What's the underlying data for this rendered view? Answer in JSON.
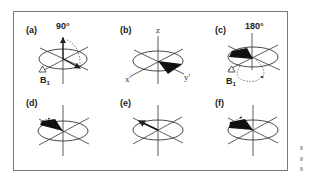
{
  "figure": {
    "panels": [
      {
        "id": "a",
        "label": "(a)",
        "annotation": "90°",
        "field_label": "B",
        "field_sub": "1"
      },
      {
        "id": "b",
        "label": "(b)",
        "axis_z": "z",
        "axis_x": "x'",
        "axis_y": "y'"
      },
      {
        "id": "c",
        "label": "(c)",
        "annotation": "180°",
        "field_label": "B",
        "field_sub": "1"
      },
      {
        "id": "d",
        "label": "(d)"
      },
      {
        "id": "e",
        "label": "(e)"
      },
      {
        "id": "f",
        "label": "(f)"
      }
    ]
  },
  "colors": {
    "ink": "#222222",
    "frame": "#7a7a7a",
    "background": "#ffffff"
  }
}
